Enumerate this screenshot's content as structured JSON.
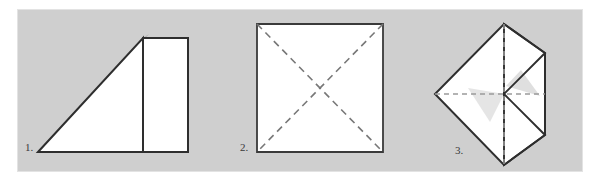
{
  "panel": {
    "background_color": "#cfcfcf",
    "page_background_color": "#ffffff",
    "border_color": "#e3e3e3",
    "ink_color": "#2e2e2e",
    "paper_color": "#ffffff",
    "shadow_color": "#a9a9a9",
    "crease_color": "#8a8a8a"
  },
  "figures": [
    {
      "id": "figure-1",
      "label": "1.",
      "description": "folded-triangle-with-upright-rectangle",
      "shapes": [
        {
          "name": "triangle",
          "type": "polygon",
          "points": "38,152 143,38 143,152",
          "fill": "#ffffff"
        },
        {
          "name": "rectangle",
          "type": "polygon",
          "points": "143,38 188,38 188,152 143,152",
          "fill": "#ffffff"
        },
        {
          "name": "hypotenuse-shadow",
          "type": "polygon",
          "points": "38,152 143,38 149,34 44,152",
          "fill": "#a9a9a9"
        }
      ]
    },
    {
      "id": "figure-2",
      "label": "2.",
      "description": "square-with-dashed-diagonal-creases",
      "shapes": [
        {
          "name": "square",
          "type": "polygon",
          "points": "257,24 383,24 383,152 257,152",
          "fill": "#ffffff"
        }
      ],
      "creases": [
        {
          "name": "diagonal-crease-tl-br",
          "x1": 257,
          "y1": 24,
          "x2": 383,
          "y2": 152
        },
        {
          "name": "diagonal-crease-tr-bl",
          "x1": 383,
          "y1": 24,
          "x2": 257,
          "y2": 152
        }
      ]
    },
    {
      "id": "figure-3",
      "label": "3.",
      "description": "kite-shape-with-two-folded-triangular-flaps",
      "shapes": [
        {
          "name": "kite-body",
          "type": "polygon",
          "points": "504,24 545,53 545,135 504,165 435,94",
          "fill": "#ffffff"
        },
        {
          "name": "upper-flap",
          "type": "polygon",
          "points": "504,24 545,53 504,94",
          "fill": "#fdfdfd"
        },
        {
          "name": "lower-flap",
          "type": "polygon",
          "points": "504,94 545,135 504,165",
          "fill": "#fdfdfd"
        },
        {
          "name": "flap-shadow-upper",
          "type": "polygon",
          "points": "504,88 538,95 520,72",
          "fill": "#d2d2d2"
        },
        {
          "name": "flap-shadow-left",
          "type": "polygon",
          "points": "470,90 504,94 492,120",
          "fill": "#d8d8d8"
        }
      ],
      "creases": [
        {
          "name": "vertical-crease",
          "x1": 504,
          "y1": 24,
          "x2": 504,
          "y2": 165
        },
        {
          "name": "horizontal-crease",
          "x1": 435,
          "y1": 94,
          "x2": 545,
          "y2": 94
        }
      ],
      "fold_edges": [
        {
          "name": "upper-flap-edge",
          "x1": 545,
          "y1": 53,
          "x2": 504,
          "y2": 94
        },
        {
          "name": "lower-flap-edge",
          "x1": 504,
          "y1": 94,
          "x2": 545,
          "y2": 135
        }
      ]
    }
  ]
}
